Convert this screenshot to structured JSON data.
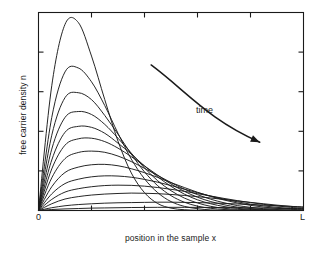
{
  "figure": {
    "background_color": "#ffffff",
    "line_color": "#1a1a1a",
    "frame_color": "#1a1a1a"
  },
  "labels": {
    "ylabel": "free carrier density n",
    "xlabel": "position in the sample x",
    "x_tick_origin": "0",
    "x_tick_length": "L",
    "annotation_time": "time"
  },
  "chart_data": {
    "type": "line",
    "title": "",
    "subtitle": "",
    "xlabel": "position in the sample x",
    "ylabel": "free carrier density n",
    "xlim": [
      0,
      1
    ],
    "ylim": [
      0,
      1
    ],
    "grid": false,
    "legend_position": "none",
    "x_tick_labels": [
      "0",
      "L"
    ],
    "x_tick_values": [
      0,
      1
    ],
    "y_tick_labels": [],
    "n_x_ticks_interior": 4,
    "n_y_ticks_interior": 4,
    "annotations": [
      {
        "text": "time",
        "x": 0.595,
        "y": 0.525,
        "arrow": {
          "start": [
            0.425,
            0.735
          ],
          "control1": [
            0.56,
            0.6
          ],
          "control2": [
            0.64,
            0.46
          ],
          "end": [
            0.835,
            0.345
          ],
          "style": "curved-arrow-with-head"
        }
      }
    ],
    "series": [
      {
        "name": "t1",
        "peak_x": 0.15,
        "peak_y": 0.955,
        "values": [
          0.0,
          0.63,
          0.94,
          0.95,
          0.78,
          0.56,
          0.35,
          0.19,
          0.09,
          0.035,
          0.012,
          0.004,
          0.001,
          0.0,
          0.0,
          0.0,
          0.0,
          0.0,
          0.0,
          0.0,
          0.0
        ]
      },
      {
        "name": "t2",
        "peak_x": 0.2,
        "peak_y": 0.72,
        "values": [
          0.0,
          0.47,
          0.7,
          0.72,
          0.65,
          0.53,
          0.39,
          0.26,
          0.16,
          0.09,
          0.045,
          0.021,
          0.009,
          0.003,
          0.001,
          0.0,
          0.0,
          0.0,
          0.0,
          0.0,
          0.0
        ]
      },
      {
        "name": "t3",
        "peak_x": 0.225,
        "peak_y": 0.595,
        "values": [
          0.0,
          0.38,
          0.57,
          0.595,
          0.56,
          0.48,
          0.385,
          0.285,
          0.195,
          0.125,
          0.075,
          0.042,
          0.022,
          0.011,
          0.005,
          0.002,
          0.001,
          0.0,
          0.0,
          0.0,
          0.0
        ]
      },
      {
        "name": "t4",
        "peak_x": 0.25,
        "peak_y": 0.5,
        "values": [
          0.0,
          0.31,
          0.47,
          0.5,
          0.485,
          0.435,
          0.365,
          0.29,
          0.215,
          0.15,
          0.1,
          0.063,
          0.038,
          0.021,
          0.011,
          0.006,
          0.003,
          0.001,
          0.0,
          0.0,
          0.0
        ]
      },
      {
        "name": "t5",
        "peak_x": 0.275,
        "peak_y": 0.425,
        "values": [
          0.0,
          0.255,
          0.395,
          0.425,
          0.42,
          0.39,
          0.34,
          0.285,
          0.225,
          0.17,
          0.122,
          0.083,
          0.054,
          0.034,
          0.02,
          0.011,
          0.006,
          0.003,
          0.001,
          0.0,
          0.0
        ]
      },
      {
        "name": "t6",
        "peak_x": 0.3,
        "peak_y": 0.365,
        "values": [
          0.0,
          0.21,
          0.33,
          0.362,
          0.365,
          0.348,
          0.315,
          0.272,
          0.225,
          0.178,
          0.134,
          0.097,
          0.067,
          0.045,
          0.029,
          0.017,
          0.01,
          0.005,
          0.002,
          0.001,
          0.0
        ]
      },
      {
        "name": "t7",
        "peak_x": 0.34,
        "peak_y": 0.3,
        "values": [
          0.0,
          0.165,
          0.262,
          0.293,
          0.3,
          0.294,
          0.275,
          0.247,
          0.213,
          0.177,
          0.141,
          0.108,
          0.08,
          0.057,
          0.039,
          0.025,
          0.016,
          0.009,
          0.005,
          0.002,
          0.001
        ]
      },
      {
        "name": "t8",
        "peak_x": 0.39,
        "peak_y": 0.235,
        "values": [
          0.0,
          0.12,
          0.192,
          0.219,
          0.231,
          0.233,
          0.226,
          0.211,
          0.191,
          0.167,
          0.141,
          0.116,
          0.092,
          0.071,
          0.053,
          0.038,
          0.026,
          0.017,
          0.011,
          0.006,
          0.003
        ]
      },
      {
        "name": "t9",
        "peak_x": 0.45,
        "peak_y": 0.175,
        "values": [
          0.0,
          0.084,
          0.136,
          0.158,
          0.17,
          0.175,
          0.174,
          0.168,
          0.157,
          0.143,
          0.126,
          0.108,
          0.09,
          0.073,
          0.057,
          0.044,
          0.032,
          0.023,
          0.016,
          0.01,
          0.006
        ]
      },
      {
        "name": "t10",
        "peak_x": 0.52,
        "peak_y": 0.128,
        "values": [
          0.0,
          0.056,
          0.093,
          0.11,
          0.12,
          0.126,
          0.128,
          0.127,
          0.123,
          0.116,
          0.107,
          0.097,
          0.085,
          0.073,
          0.061,
          0.05,
          0.04,
          0.031,
          0.023,
          0.016,
          0.011
        ]
      },
      {
        "name": "t11",
        "peak_x": 0.6,
        "peak_y": 0.088,
        "values": [
          0.0,
          0.034,
          0.058,
          0.07,
          0.078,
          0.083,
          0.086,
          0.088,
          0.087,
          0.085,
          0.081,
          0.076,
          0.07,
          0.063,
          0.056,
          0.048,
          0.041,
          0.034,
          0.027,
          0.021,
          0.016
        ]
      },
      {
        "name": "t12",
        "peak_x": 0.7,
        "peak_y": 0.042,
        "values": [
          0.0,
          0.014,
          0.024,
          0.03,
          0.034,
          0.037,
          0.039,
          0.04,
          0.041,
          0.042,
          0.042,
          0.041,
          0.04,
          0.038,
          0.036,
          0.033,
          0.03,
          0.027,
          0.024,
          0.021,
          0.018
        ]
      },
      {
        "name": "t13",
        "peak_x": 0.78,
        "peak_y": 0.016,
        "values": [
          0.0,
          0.005,
          0.008,
          0.01,
          0.012,
          0.013,
          0.014,
          0.015,
          0.0155,
          0.016,
          0.016,
          0.016,
          0.0158,
          0.0154,
          0.0148,
          0.0141,
          0.0133,
          0.0124,
          0.0114,
          0.0104,
          0.0094
        ]
      }
    ]
  }
}
